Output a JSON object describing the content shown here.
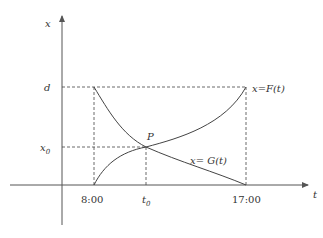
{
  "diagram": {
    "type": "function-graph",
    "axes": {
      "x_axis_label": "t",
      "y_axis_label": "x"
    },
    "ticks": {
      "t_start": "8:00",
      "t_mid": "t",
      "t_mid_sub": "0",
      "t_end": "17:00",
      "x_top": "d",
      "x_mid": "x",
      "x_mid_sub": "0"
    },
    "curves": [
      {
        "name": "F",
        "label": "x=F(t)",
        "description": "increasing from 0 at 8:00 to d at 17:00"
      },
      {
        "name": "G",
        "label": "x= G(t)",
        "description": "decreasing from d at 8:00 to 0 at 17:00"
      }
    ],
    "intersection": {
      "label": "P",
      "t": "t0",
      "x": "x0"
    }
  }
}
